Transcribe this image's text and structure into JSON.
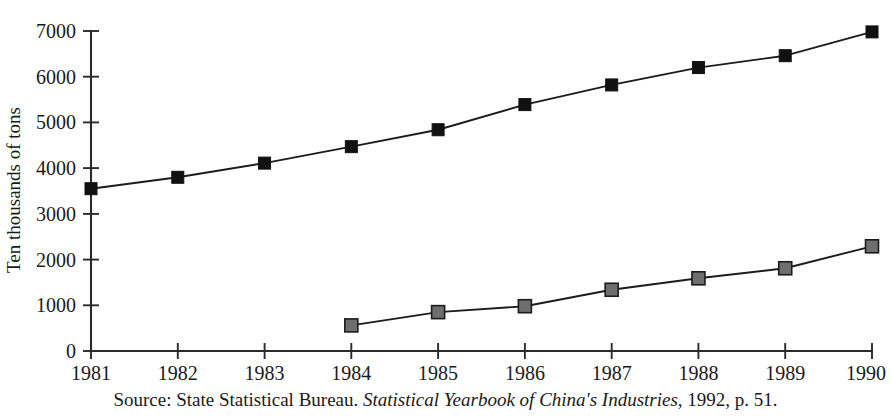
{
  "chart_data": {
    "type": "line",
    "title": "",
    "subtitle": "",
    "xlabel": "",
    "ylabel": "Ten thousands of tons",
    "categories": [
      "1981",
      "1982",
      "1983",
      "1984",
      "1985",
      "1986",
      "1987",
      "1988",
      "1989",
      "1990"
    ],
    "x": [
      1981,
      1982,
      1983,
      1984,
      1985,
      1986,
      1987,
      1988,
      1989,
      1990
    ],
    "xlim": [
      1981,
      1990
    ],
    "ylim": [
      0,
      7000
    ],
    "y_ticks": [
      0,
      1000,
      2000,
      3000,
      4000,
      5000,
      6000,
      7000
    ],
    "y_tick_labels": [
      "0",
      "1000",
      "2000",
      "3000",
      "4000",
      "5000",
      "6000",
      "7000"
    ],
    "x_tick_labels": [
      "1981",
      "1982",
      "1983",
      "1984",
      "1985",
      "1986",
      "1987",
      "1988",
      "1989",
      "1990"
    ],
    "grid": false,
    "legend": "none",
    "series": [
      {
        "name": "upper-series",
        "marker": "filled-square-black",
        "color": "#111111",
        "values": [
          3550,
          3800,
          4110,
          4470,
          4840,
          5390,
          5820,
          6200,
          6460,
          6980
        ]
      },
      {
        "name": "lower-series",
        "marker": "filled-square-gray",
        "color": "#6e6e6e",
        "values": [
          null,
          null,
          null,
          560,
          850,
          980,
          1340,
          1590,
          1810,
          2290
        ]
      }
    ]
  },
  "axis": {
    "y_title": "Ten thousands of tons",
    "axis_color": "#2b2b2b"
  },
  "caption": {
    "prefix": "Source: State Statistical Bureau. ",
    "italic_title": "Statistical Yearbook of China's Industries",
    "suffix": ", 1992, p. 51.",
    "full": "Source: State Statistical Bureau. Statistical Yearbook of China's Industries, 1992, p. 51."
  },
  "colors": {
    "background": "#ffffff",
    "ink": "#1a1a1a",
    "upper_marker": "#111111",
    "lower_marker": "#6e6e6e"
  }
}
